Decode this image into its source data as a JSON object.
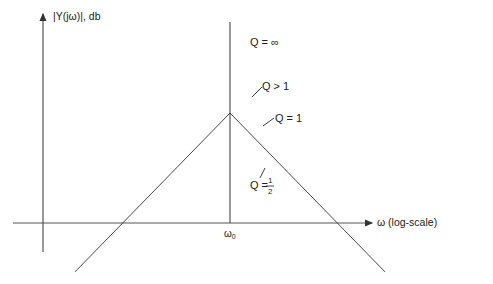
{
  "figure": {
    "y_axis_label": "|Y(jω)|, db",
    "x_axis_label": "ω (log-scale)",
    "center_tick_label": "ω",
    "center_tick_subscript": "0",
    "colors": {
      "ink": "#1a1a1a",
      "axis": "#555555",
      "background": "#ffffff"
    }
  },
  "curves": [
    {
      "id": "q-infinity",
      "label": "Q = ∞",
      "Q": "infinity"
    },
    {
      "id": "q-gt-1",
      "label": "Q > 1",
      "Q": 2.5
    },
    {
      "id": "q-1",
      "label": "Q = 1",
      "Q": 1
    },
    {
      "id": "q-half",
      "label_prefix": "Q =",
      "label_num": "1",
      "label_den": "2",
      "Q": 0.5
    }
  ],
  "asymptotes": {
    "slope_db_per_decade": 20,
    "description": "straight-line asymptotes meeting at ω0"
  }
}
